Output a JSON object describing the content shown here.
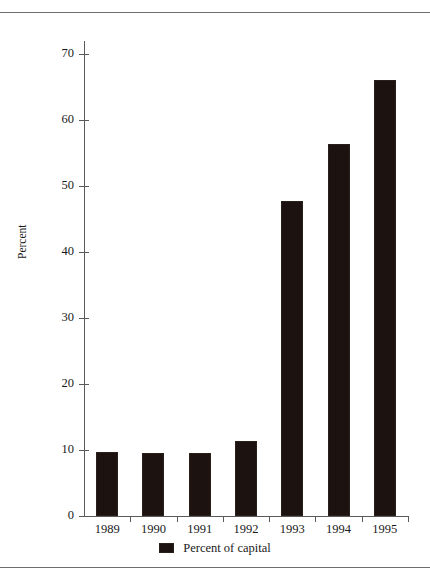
{
  "chart_data": {
    "type": "bar",
    "title": "",
    "subtitle": "",
    "xlabel": "",
    "ylabel": "Percent",
    "categories": [
      "1989",
      "1990",
      "1991",
      "1992",
      "1993",
      "1994",
      "1995"
    ],
    "series": [
      {
        "name": "Percent of capital",
        "values": [
          9.7,
          9.6,
          9.6,
          11.3,
          47.8,
          56.3,
          66.1
        ],
        "color": "#1c1310"
      }
    ],
    "ylim": [
      0,
      70
    ],
    "ytick_values": [
      0,
      10,
      20,
      30,
      40,
      50,
      60,
      70
    ],
    "ytick_labels": [
      "0",
      "10",
      "20",
      "30",
      "40",
      "50",
      "60",
      "70"
    ],
    "grid": false,
    "legend": {
      "position": "bottom-center",
      "entries": [
        {
          "label": "Percent of capital",
          "swatch_color": "#1c1310"
        }
      ]
    },
    "axis_color": "#5a5a5a",
    "background": "#ffffff"
  },
  "figure": {
    "top_rule": "",
    "bottom_rule": ""
  }
}
